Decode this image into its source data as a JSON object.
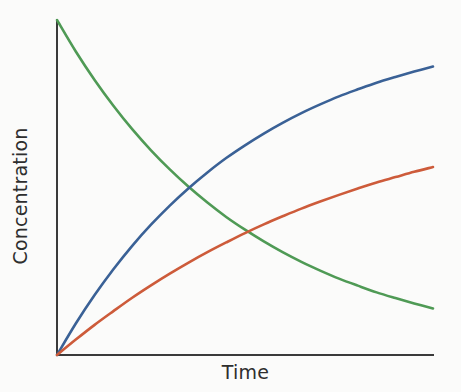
{
  "figure": {
    "background_color": "#fbfbfa",
    "axis_color": "#3a3a3a",
    "axis_line_width": 2.0
  },
  "chart_data": {
    "type": "line",
    "title": "",
    "subtitle": "",
    "xlabel": "Time",
    "ylabel": "Concentration",
    "grid": false,
    "legend": null,
    "legend_position": "none",
    "xlim": [
      0,
      1
    ],
    "ylim": [
      0,
      1
    ],
    "x_tick_labels": [],
    "y_tick_labels": [],
    "annotations": [],
    "x": [
      0,
      0.05,
      0.1,
      0.15,
      0.2,
      0.25,
      0.3,
      0.35,
      0.4,
      0.45,
      0.5,
      0.55,
      0.6,
      0.65,
      0.7,
      0.75,
      0.8,
      0.85,
      0.9,
      0.95,
      1
    ],
    "series": [
      {
        "name": "reactant-decay",
        "color": "#4f9a55",
        "line_width": 2.6,
        "shape": "exponential-decay",
        "values": [
          1.0,
          0.906,
          0.821,
          0.744,
          0.674,
          0.611,
          0.554,
          0.502,
          0.455,
          0.412,
          0.374,
          0.339,
          0.307,
          0.278,
          0.252,
          0.228,
          0.207,
          0.187,
          0.17,
          0.154,
          0.139
        ]
      },
      {
        "name": "product-major-rise",
        "color": "#3a6196",
        "line_width": 2.6,
        "shape": "saturating-rise",
        "values": [
          0.0,
          0.094,
          0.179,
          0.256,
          0.326,
          0.389,
          0.446,
          0.498,
          0.545,
          0.588,
          0.626,
          0.661,
          0.693,
          0.722,
          0.748,
          0.772,
          0.793,
          0.813,
          0.83,
          0.846,
          0.861
        ]
      },
      {
        "name": "product-minor-rise",
        "color": "#cd5b3a",
        "line_width": 2.6,
        "shape": "saturating-rise-slow",
        "values": [
          0.0,
          0.046,
          0.09,
          0.131,
          0.171,
          0.208,
          0.243,
          0.276,
          0.307,
          0.336,
          0.364,
          0.39,
          0.414,
          0.437,
          0.458,
          0.478,
          0.497,
          0.515,
          0.531,
          0.547,
          0.561
        ]
      }
    ],
    "intersections": [
      {
        "name": "blue-green-crossover",
        "x": 0.46,
        "y": 0.493
      },
      {
        "name": "red-green-crossover",
        "x": 0.915,
        "y": 0.542
      }
    ]
  }
}
